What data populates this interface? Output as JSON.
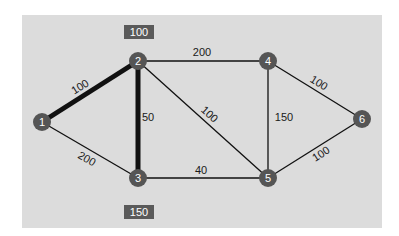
{
  "diagram": {
    "type": "weighted-graph",
    "colors": {
      "panel": "#dcdcdc",
      "node_fill": "#555555",
      "node_text": "#ffffff",
      "edge": "#111111",
      "box_fill": "#5a5a5a",
      "box_text": "#ffffff"
    },
    "nodes": [
      {
        "id": "1",
        "label": "1",
        "x": 42,
        "y": 122
      },
      {
        "id": "2",
        "label": "2",
        "x": 138,
        "y": 61
      },
      {
        "id": "3",
        "label": "3",
        "x": 138,
        "y": 178
      },
      {
        "id": "4",
        "label": "4",
        "x": 268,
        "y": 61
      },
      {
        "id": "5",
        "label": "5",
        "x": 268,
        "y": 178
      },
      {
        "id": "6",
        "label": "6",
        "x": 362,
        "y": 119
      }
    ],
    "edges": [
      {
        "from": "1",
        "to": "2",
        "weight": "100",
        "highlighted": true
      },
      {
        "from": "1",
        "to": "3",
        "weight": "200",
        "highlighted": false
      },
      {
        "from": "2",
        "to": "3",
        "weight": "50",
        "highlighted": true
      },
      {
        "from": "2",
        "to": "4",
        "weight": "200",
        "highlighted": false
      },
      {
        "from": "2",
        "to": "5",
        "weight": "100",
        "highlighted": false
      },
      {
        "from": "3",
        "to": "5",
        "weight": "40",
        "highlighted": false
      },
      {
        "from": "4",
        "to": "5",
        "weight": "150",
        "highlighted": false
      },
      {
        "from": "4",
        "to": "6",
        "weight": "100",
        "highlighted": false
      },
      {
        "from": "5",
        "to": "6",
        "weight": "100",
        "highlighted": false
      }
    ],
    "boxes": [
      {
        "label": "100",
        "near_node": "2"
      },
      {
        "label": "150",
        "near_node": "3"
      }
    ]
  }
}
